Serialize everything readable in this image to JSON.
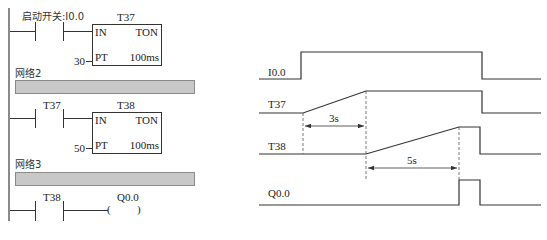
{
  "ladder": {
    "networks": [
      {
        "label": "",
        "contact_label": "启动开关:I0.0",
        "timer_name": "T37",
        "timer_in": "IN",
        "timer_type": "TON",
        "timer_pt_value": "30",
        "timer_pt": "PT",
        "timer_base": "100ms"
      },
      {
        "label": "网络2",
        "contact_label": "T37",
        "timer_name": "T38",
        "timer_in": "IN",
        "timer_type": "TON",
        "timer_pt_value": "50",
        "timer_pt": "PT",
        "timer_base": "100ms"
      },
      {
        "label": "网络3",
        "contact_label": "T38",
        "coil_label": "Q0.0",
        "coil_open": "(",
        "coil_close": ")"
      }
    ]
  },
  "timing": {
    "signals": [
      {
        "name": "I0.0"
      },
      {
        "name": "T37"
      },
      {
        "name": "T38"
      },
      {
        "name": "Q0.0"
      }
    ],
    "intervals": [
      {
        "label": "3s"
      },
      {
        "label": "5s"
      }
    ]
  },
  "colors": {
    "line": "#333333",
    "rail": "#8a8a8a",
    "network_bar": "#c8c8c8"
  }
}
